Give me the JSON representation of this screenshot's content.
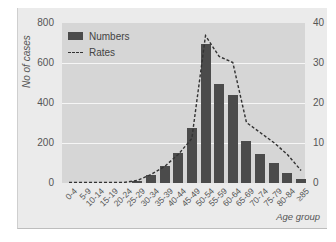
{
  "chart_data": {
    "type": "bar",
    "title": "",
    "xlabel": "Age group",
    "ylabel": "No of cases",
    "y2label": "",
    "categories": [
      "0-4",
      "5-9",
      "10-14",
      "15-19",
      "20-24",
      "25-29",
      "30-34",
      "35-39",
      "40-44",
      "45-49",
      "50-54",
      "55-59",
      "60-64",
      "65-69",
      "70-74",
      "75-79",
      "80-84",
      "≥85"
    ],
    "series": [
      {
        "name": "Numbers",
        "type": "bar",
        "axis": "left",
        "values": [
          0,
          0,
          0,
          0,
          0,
          10,
          40,
          85,
          150,
          275,
          695,
          495,
          440,
          210,
          145,
          100,
          50,
          20
        ]
      },
      {
        "name": "Rates",
        "type": "line",
        "style": "dashed",
        "axis": "right",
        "values": [
          0,
          0,
          0,
          0,
          0,
          0.5,
          2,
          4,
          7,
          11,
          36.7,
          31.5,
          30,
          15,
          12.5,
          10,
          7,
          3
        ]
      }
    ],
    "ylim": [
      0,
      800
    ],
    "y2lim": [
      0,
      40
    ],
    "yticks": [
      0,
      200,
      400,
      600,
      800
    ],
    "y2ticks": [
      0,
      10,
      20,
      30,
      40
    ],
    "grid": true,
    "legend_position": "upper-left"
  },
  "axis": {
    "ylabel": "No of cases",
    "xlabel": "Age group"
  },
  "legend": {
    "numbers": "Numbers",
    "rates": "Rates"
  },
  "colors": {
    "bar": "#4b4b4b",
    "plot_bg": "#d6d6d6",
    "panel_bg": "#ebebeb",
    "grid": "#f6f6f6",
    "line": "#333333"
  }
}
